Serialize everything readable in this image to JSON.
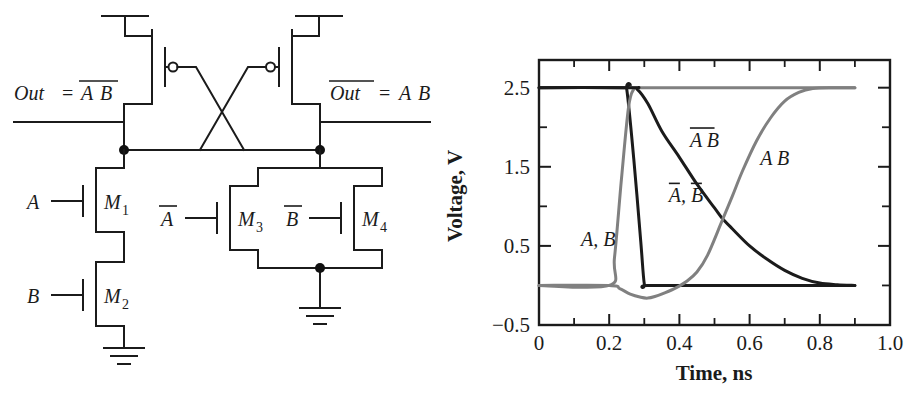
{
  "figure": {
    "panels": [
      "circuit-schematic",
      "transient-plot"
    ]
  },
  "circuit": {
    "labels": {
      "out_left_prefix": "Out",
      "out_left_eq": "=",
      "out_left_expr_a": "A",
      "out_left_expr_b": "B",
      "out_left_full": "Out = A B (A B overbarred)",
      "out_right_prefix": "Out",
      "out_right_eq": "=",
      "out_right_expr_a": "A",
      "out_right_expr_b": "B",
      "out_right_full": "Out (overbarred) = A B"
    },
    "transistors": [
      {
        "id": "M1",
        "name_base": "M",
        "name_sub": "1",
        "type": "nmos",
        "gate_label": "A",
        "gate_label_bar": false
      },
      {
        "id": "M2",
        "name_base": "M",
        "name_sub": "2",
        "type": "nmos",
        "gate_label": "B",
        "gate_label_bar": false
      },
      {
        "id": "M3",
        "name_base": "M",
        "name_sub": "3",
        "type": "nmos",
        "gate_label": "A",
        "gate_label_bar": true
      },
      {
        "id": "M4",
        "name_base": "M",
        "name_sub": "4",
        "type": "nmos",
        "gate_label": "B",
        "gate_label_bar": true
      }
    ],
    "pmos": [
      {
        "id": "MP-left",
        "type": "pmos",
        "note": "top-left pull-up, gate driven from right node"
      },
      {
        "id": "MP-right",
        "type": "pmos",
        "note": "top-right pull-up, gate driven from left node"
      }
    ],
    "nets": [
      {
        "id": "vdd-left",
        "label": ""
      },
      {
        "id": "vdd-right",
        "label": ""
      },
      {
        "id": "gnd-left",
        "label": ""
      },
      {
        "id": "gnd-right",
        "label": ""
      }
    ],
    "colors": {
      "wire": "#1b1b1b",
      "node_dot": "#111111"
    }
  },
  "chart_data": {
    "type": "line",
    "title": "",
    "xlabel": "Time, ns",
    "ylabel": "Voltage, V",
    "xlim": [
      0,
      1.0
    ],
    "ylim": [
      -0.5,
      2.85
    ],
    "grid": false,
    "legend": "inline-annotations",
    "x_ticks_major": [
      0,
      0.2,
      0.4,
      0.6,
      0.8,
      1.0
    ],
    "x_tick_labels": [
      "0",
      "0.2",
      "0.4",
      "0.6",
      "0.8",
      "1.0"
    ],
    "x_ticks_minor": [
      0.1,
      0.3,
      0.5,
      0.7,
      0.9
    ],
    "y_ticks_major": [
      -0.5,
      0.5,
      1.5,
      2.5
    ],
    "y_tick_labels": [
      "−0.5",
      "0.5",
      "1.5",
      "2.5"
    ],
    "y_ticks_minor": [
      0,
      1.0,
      2.0
    ],
    "colors": {
      "dark_curve": "#1b1b1b",
      "light_curve": "#808080",
      "axis": "#1b1b1b"
    },
    "series": [
      {
        "name": "A, B",
        "annotation": "A, B",
        "annotation_bar": "none",
        "color": "#1b1b1b",
        "description": "Inputs A and B: hold 2.5 V until 0.25 ns, fall sharply to 0 V by 0.30 ns, then stay at 0 V.",
        "points": [
          [
            0.0,
            2.5
          ],
          [
            0.24,
            2.5
          ],
          [
            0.25,
            2.48
          ],
          [
            0.27,
            1.6
          ],
          [
            0.29,
            0.55
          ],
          [
            0.3,
            0.02
          ],
          [
            0.31,
            0.0
          ],
          [
            0.5,
            0.0
          ],
          [
            0.9,
            0.0
          ]
        ]
      },
      {
        "name": "Abar, Bbar",
        "annotation": "A, B",
        "annotation_bar": "each",
        "color": "#808080",
        "description": "Complemented inputs: 0 V until 0.20 ns, rise sharply to 2.5 V by 0.27 ns, then stay at 2.5 V.",
        "points": [
          [
            0.0,
            0.0
          ],
          [
            0.2,
            0.0
          ],
          [
            0.215,
            0.35
          ],
          [
            0.235,
            1.35
          ],
          [
            0.255,
            2.25
          ],
          [
            0.27,
            2.48
          ],
          [
            0.29,
            2.5
          ],
          [
            0.6,
            2.5
          ],
          [
            0.9,
            2.5
          ]
        ]
      },
      {
        "name": "AB-bar (NAND out)",
        "annotation": "A B",
        "annotation_bar": "span",
        "color": "#1b1b1b",
        "description": "NAND output Out = A·B complemented: held at 2.5 V, falls from 0.27 ns with a long RC tail, crosses the AND output near 0.52 ns at ~0.85 V, settles at 0 V by ~0.80 ns.",
        "points": [
          [
            0.0,
            2.5
          ],
          [
            0.26,
            2.5
          ],
          [
            0.28,
            2.48
          ],
          [
            0.31,
            2.3
          ],
          [
            0.35,
            1.95
          ],
          [
            0.4,
            1.62
          ],
          [
            0.45,
            1.28
          ],
          [
            0.5,
            0.98
          ],
          [
            0.52,
            0.86
          ],
          [
            0.55,
            0.72
          ],
          [
            0.6,
            0.5
          ],
          [
            0.65,
            0.33
          ],
          [
            0.7,
            0.19
          ],
          [
            0.75,
            0.09
          ],
          [
            0.8,
            0.03
          ],
          [
            0.85,
            0.01
          ],
          [
            0.9,
            0.0
          ]
        ]
      },
      {
        "name": "A B (AND out)",
        "annotation": "A B",
        "annotation_bar": "none",
        "color": "#808080",
        "description": "AND output: sits at 0 V, dips slightly negative (~-0.15 V) near 0.31 ns from charge injection, then rises with an S-curve, crossing the NAND output near 0.52 ns, reaching 2.5 V at ~0.78 ns.",
        "points": [
          [
            0.0,
            0.0
          ],
          [
            0.2,
            0.0
          ],
          [
            0.23,
            -0.04
          ],
          [
            0.26,
            -0.11
          ],
          [
            0.29,
            -0.15
          ],
          [
            0.31,
            -0.16
          ],
          [
            0.33,
            -0.14
          ],
          [
            0.36,
            -0.09
          ],
          [
            0.39,
            -0.03
          ],
          [
            0.42,
            0.05
          ],
          [
            0.45,
            0.17
          ],
          [
            0.48,
            0.38
          ],
          [
            0.52,
            0.8
          ],
          [
            0.55,
            1.12
          ],
          [
            0.58,
            1.45
          ],
          [
            0.62,
            1.83
          ],
          [
            0.66,
            2.12
          ],
          [
            0.7,
            2.33
          ],
          [
            0.74,
            2.44
          ],
          [
            0.78,
            2.49
          ],
          [
            0.84,
            2.5
          ],
          [
            0.9,
            2.5
          ]
        ]
      }
    ],
    "annotations": [
      {
        "text": "A, B",
        "bar": "none",
        "x": 0.12,
        "y": 0.5
      },
      {
        "text": "A, B",
        "bar": "each",
        "x": 0.37,
        "y": 1.05
      },
      {
        "text": "A B",
        "bar": "span",
        "x": 0.43,
        "y": 1.75
      },
      {
        "text": "A B",
        "bar": "none",
        "x": 0.63,
        "y": 1.52
      }
    ]
  }
}
